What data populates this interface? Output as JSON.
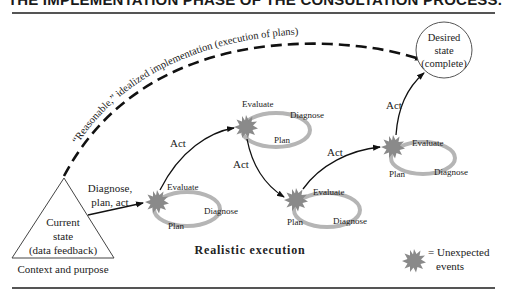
{
  "title": "THE IMPLEMENTATION PHASE OF THE CONSULTATION PROCESS.",
  "idealized_path_label": "“Reasonable,” idealized implementation (execution of plans)",
  "current_state": {
    "line1": "Current",
    "line2": "state",
    "line3": "(data feedback)",
    "caption": "Context and purpose"
  },
  "desired_state": {
    "line1": "Desired",
    "line2": "state",
    "line3": "(complete)"
  },
  "initial_transition": {
    "line1": "Diagnose,",
    "line2": "plan, act"
  },
  "cycles": [
    {
      "evaluate": "Evaluate",
      "diagnose": "Diagnose",
      "plan": "Plan"
    },
    {
      "evaluate": "Evaluate",
      "diagnose": "Diagnose",
      "plan": "Plan"
    },
    {
      "evaluate": "Evaluate",
      "diagnose": "Diagnose",
      "plan": "Plan"
    },
    {
      "evaluate": "Evaluate",
      "diagnose": "Diagnose",
      "plan": "Plan"
    }
  ],
  "act_labels": [
    "Act",
    "Act",
    "Act",
    "Act"
  ],
  "realistic_label": "Realistic execution",
  "legend": {
    "line1": "= Unexpected",
    "line2": "events"
  },
  "colors": {
    "starburst": "#8a8a8a",
    "loop": "#b5b5b5",
    "line": "#111111",
    "rule": "#555555"
  }
}
